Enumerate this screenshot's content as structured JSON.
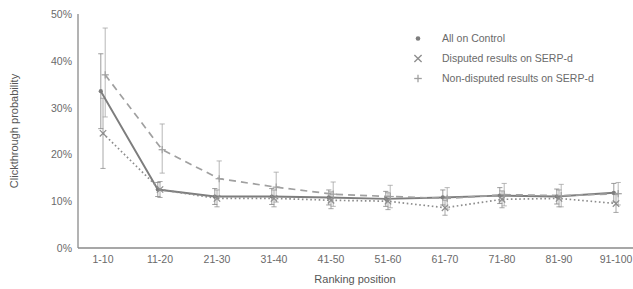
{
  "chart_data": {
    "type": "line",
    "title": "",
    "xlabel": "Ranking position",
    "ylabel": "Clickthrough probability",
    "categories": [
      "1-10",
      "11-20",
      "21-30",
      "31-40",
      "41-50",
      "51-60",
      "61-70",
      "71-80",
      "81-90",
      "91-100"
    ],
    "ylim": [
      0,
      50
    ],
    "ytick_labels": [
      "0%",
      "10%",
      "20%",
      "30%",
      "40%",
      "50%"
    ],
    "ytick_values": [
      0,
      10,
      20,
      30,
      40,
      50
    ],
    "grid": false,
    "legend_position": "top-right",
    "series": [
      {
        "name": "All on Control",
        "marker": "dot",
        "line_style": "solid",
        "color": "#7d7d7d",
        "values": [
          33.5,
          12.5,
          11.0,
          11.0,
          10.8,
          10.5,
          10.8,
          11.2,
          11.0,
          11.8
        ],
        "error_low": [
          25.5,
          11.0,
          9.3,
          9.3,
          9.2,
          8.9,
          9.2,
          9.5,
          9.4,
          9.8
        ],
        "error_high": [
          41.5,
          14.0,
          12.7,
          12.7,
          12.4,
          12.1,
          12.4,
          12.9,
          12.6,
          13.8
        ]
      },
      {
        "name": "Disputed results on SERP-d",
        "marker": "cross",
        "line_style": "dotted",
        "color": "#8c8c8c",
        "values": [
          24.5,
          12.5,
          10.6,
          10.6,
          10.2,
          10.0,
          8.6,
          10.4,
          10.6,
          9.5
        ],
        "error_low": [
          17.0,
          10.8,
          8.8,
          8.8,
          8.4,
          8.2,
          7.0,
          8.6,
          8.8,
          7.6
        ],
        "error_high": [
          32.0,
          14.2,
          12.4,
          12.4,
          12.0,
          11.8,
          10.2,
          12.2,
          12.4,
          11.4
        ]
      },
      {
        "name": "Non-disputed results on SERP-d",
        "marker": "plus",
        "line_style": "dashed",
        "color": "#a0a0a0",
        "values": [
          37.0,
          21.0,
          14.8,
          13.0,
          11.5,
          11.0,
          10.6,
          11.4,
          11.2,
          11.6
        ],
        "error_low": [
          28.0,
          16.0,
          11.0,
          9.8,
          8.9,
          8.6,
          8.3,
          9.0,
          8.8,
          9.2
        ],
        "error_high": [
          47.0,
          26.5,
          18.6,
          16.2,
          14.1,
          13.4,
          12.9,
          13.8,
          13.6,
          14.0
        ]
      }
    ]
  },
  "legend": {
    "items": [
      {
        "label": "All on Control",
        "marker": "dot-marker"
      },
      {
        "label": "Disputed results on SERP-d",
        "marker": "cross-marker"
      },
      {
        "label": "Non-disputed results on SERP-d",
        "marker": "plus-marker"
      }
    ]
  },
  "axes": {
    "y_title": "Clickthrough probability",
    "x_title": "Ranking position"
  }
}
